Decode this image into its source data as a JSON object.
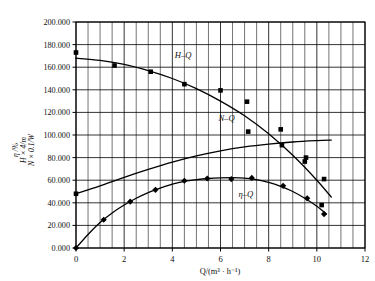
{
  "chart_data": {
    "type": "line",
    "title": "",
    "xlabel": "Q/(m³ · h⁻¹)",
    "ylabel_lines": [
      "η /%",
      "H × 4/m",
      "N × 0.1/W"
    ],
    "xlim": [
      0,
      12
    ],
    "ylim": [
      0,
      200
    ],
    "x_major_step": 2,
    "x_minor_step": 0.5,
    "y_major_step": 20,
    "grid": true,
    "legend": "inline-curve-labels",
    "x_tick_labels": [
      "0",
      "2",
      "4",
      "6",
      "8",
      "10",
      "12"
    ],
    "y_tick_labels": [
      "0.000",
      "20.000",
      "40.000",
      "60.000",
      "80.000",
      "100.000",
      "120.000",
      "140.000",
      "160.000",
      "180.000",
      "200.000"
    ],
    "series": [
      {
        "name": "H-Q",
        "label": "H–Q",
        "marker": "square",
        "label_x": 4.45,
        "label_y": 168.0,
        "points": [
          {
            "x": 0.0,
            "y": 173.0
          },
          {
            "x": 1.6,
            "y": 161.5
          },
          {
            "x": 3.1,
            "y": 156.0
          },
          {
            "x": 4.5,
            "y": 145.0
          },
          {
            "x": 6.0,
            "y": 139.5
          },
          {
            "x": 7.1,
            "y": 129.5
          },
          {
            "x": 8.5,
            "y": 105.0
          },
          {
            "x": 9.5,
            "y": 76.5
          },
          {
            "x": 10.2,
            "y": 38.0
          }
        ],
        "curve": [
          {
            "x": 0.0,
            "y": 168.0
          },
          {
            "x": 1.0,
            "y": 166.0
          },
          {
            "x": 2.0,
            "y": 162.5
          },
          {
            "x": 3.0,
            "y": 157.0
          },
          {
            "x": 4.0,
            "y": 150.0
          },
          {
            "x": 5.0,
            "y": 141.0
          },
          {
            "x": 6.0,
            "y": 130.0
          },
          {
            "x": 7.0,
            "y": 117.0
          },
          {
            "x": 8.0,
            "y": 101.0
          },
          {
            "x": 9.0,
            "y": 82.0
          },
          {
            "x": 10.0,
            "y": 60.0
          },
          {
            "x": 10.6,
            "y": 45.0
          }
        ]
      },
      {
        "name": "N-Q",
        "label": "N–Q",
        "marker": "square",
        "label_x": 6.25,
        "label_y": 112.0,
        "points": [
          {
            "x": 0.0,
            "y": 48.0
          },
          {
            "x": 7.15,
            "y": 103.0
          },
          {
            "x": 8.55,
            "y": 91.0
          },
          {
            "x": 9.55,
            "y": 80.0
          },
          {
            "x": 10.3,
            "y": 61.0
          }
        ],
        "curve": [
          {
            "x": 0.0,
            "y": 48.0
          },
          {
            "x": 1.0,
            "y": 55.0
          },
          {
            "x": 2.0,
            "y": 62.5
          },
          {
            "x": 3.0,
            "y": 69.5
          },
          {
            "x": 4.0,
            "y": 76.0
          },
          {
            "x": 5.0,
            "y": 81.5
          },
          {
            "x": 6.0,
            "y": 86.0
          },
          {
            "x": 7.0,
            "y": 89.5
          },
          {
            "x": 8.0,
            "y": 92.0
          },
          {
            "x": 9.0,
            "y": 93.8
          },
          {
            "x": 10.0,
            "y": 95.0
          },
          {
            "x": 10.6,
            "y": 95.5
          }
        ]
      },
      {
        "name": "eta-Q",
        "label": "η–Q",
        "marker": "diamond",
        "label_x": 7.05,
        "label_y": 45.0,
        "points": [
          {
            "x": 0.0,
            "y": 0.0
          },
          {
            "x": 1.15,
            "y": 25.0
          },
          {
            "x": 2.25,
            "y": 41.0
          },
          {
            "x": 3.3,
            "y": 51.5
          },
          {
            "x": 4.5,
            "y": 59.5
          },
          {
            "x": 5.45,
            "y": 61.5
          },
          {
            "x": 6.45,
            "y": 61.0
          },
          {
            "x": 7.3,
            "y": 62.0
          },
          {
            "x": 8.6,
            "y": 55.0
          },
          {
            "x": 9.6,
            "y": 44.0
          },
          {
            "x": 10.3,
            "y": 30.0
          }
        ],
        "curve": [
          {
            "x": 0.0,
            "y": 0.0
          },
          {
            "x": 0.5,
            "y": 12.0
          },
          {
            "x": 1.0,
            "y": 22.5
          },
          {
            "x": 1.5,
            "y": 31.0
          },
          {
            "x": 2.0,
            "y": 38.0
          },
          {
            "x": 2.5,
            "y": 44.0
          },
          {
            "x": 3.0,
            "y": 49.0
          },
          {
            "x": 3.5,
            "y": 53.0
          },
          {
            "x": 4.0,
            "y": 56.5
          },
          {
            "x": 4.5,
            "y": 59.0
          },
          {
            "x": 5.0,
            "y": 60.5
          },
          {
            "x": 5.5,
            "y": 61.5
          },
          {
            "x": 6.0,
            "y": 62.0
          },
          {
            "x": 6.5,
            "y": 62.2
          },
          {
            "x": 7.0,
            "y": 61.8
          },
          {
            "x": 7.5,
            "y": 60.5
          },
          {
            "x": 8.0,
            "y": 58.0
          },
          {
            "x": 8.5,
            "y": 54.5
          },
          {
            "x": 9.0,
            "y": 50.0
          },
          {
            "x": 9.5,
            "y": 44.0
          },
          {
            "x": 10.0,
            "y": 37.0
          },
          {
            "x": 10.4,
            "y": 30.0
          }
        ]
      }
    ]
  }
}
